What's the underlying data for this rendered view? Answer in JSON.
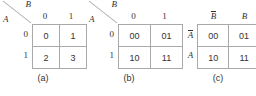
{
  "figure": {
    "kind": "two-variable-map-notation",
    "panels": [
      {
        "id": "a",
        "caption": "(a)",
        "header_style": "diagonal",
        "diagonal": {
          "upper_label": "B",
          "lower_label": "A"
        },
        "column_headers": [
          "0",
          "1"
        ],
        "row_headers": [
          "0",
          "1"
        ],
        "cells": [
          [
            "0",
            "1"
          ],
          [
            "2",
            "3"
          ]
        ]
      },
      {
        "id": "b",
        "caption": "(b)",
        "header_style": "diagonal",
        "diagonal": {
          "upper_label": "B",
          "lower_label": "A"
        },
        "column_headers": [
          "0",
          "1"
        ],
        "row_headers": [
          "0",
          "1"
        ],
        "cells": [
          [
            "00",
            "01"
          ],
          [
            "10",
            "11"
          ]
        ]
      },
      {
        "id": "c",
        "caption": "(c)",
        "header_style": "plain",
        "column_headers": [
          "B",
          "B"
        ],
        "column_header_bars": [
          true,
          false
        ],
        "row_headers": [
          "A",
          "A"
        ],
        "row_header_bars": [
          true,
          false
        ],
        "cells": [
          [
            "00",
            "01"
          ],
          [
            "10",
            "11"
          ]
        ]
      }
    ]
  },
  "colors": {
    "grid_line": "#a9a9a9",
    "text": "#333333",
    "background": "#ffffff"
  }
}
